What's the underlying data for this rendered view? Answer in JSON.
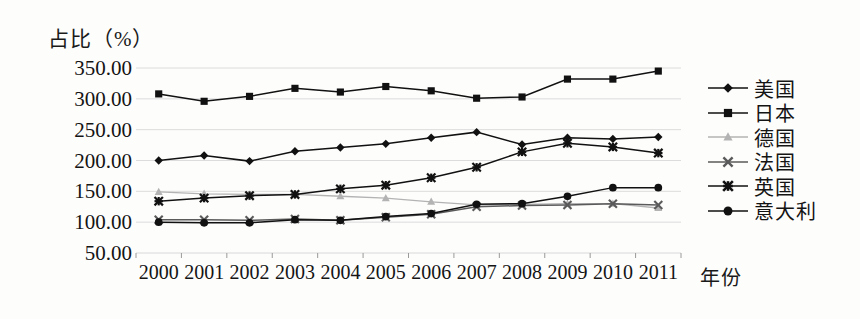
{
  "axis": {
    "y_title": "占比（%）",
    "x_title": "年份",
    "y_ticks": [
      "350.00",
      "300.00",
      "250.00",
      "200.00",
      "150.00",
      "100.00",
      "50.00"
    ],
    "x_ticks": [
      "2000",
      "2001",
      "2002",
      "2003",
      "2004",
      "2005",
      "2006",
      "2007",
      "2008",
      "2009",
      "2010",
      "2011"
    ]
  },
  "legend": {
    "items": [
      {
        "label": "美国",
        "marker": "diamond",
        "color": "#111111"
      },
      {
        "label": "日本",
        "marker": "square",
        "color": "#111111"
      },
      {
        "label": "德国",
        "marker": "triangle",
        "color": "#b3b3b3"
      },
      {
        "label": "法国",
        "marker": "cross-x",
        "color": "#5a5a5a"
      },
      {
        "label": "英国",
        "marker": "asterisk",
        "color": "#111111"
      },
      {
        "label": "意大利",
        "marker": "circle",
        "color": "#111111"
      }
    ]
  },
  "chart_data": {
    "type": "line",
    "title": "",
    "xlabel": "年份",
    "ylabel": "占比（%）",
    "x": [
      "2000",
      "2001",
      "2002",
      "2003",
      "2004",
      "2005",
      "2006",
      "2007",
      "2008",
      "2009",
      "2010",
      "2011"
    ],
    "ylim": [
      50,
      350
    ],
    "ytick_step": 50,
    "grid": true,
    "legend_position": "right",
    "series": [
      {
        "name": "美国",
        "marker": "diamond",
        "color": "#111111",
        "values": [
          200,
          208,
          199,
          215,
          221,
          227,
          237,
          246,
          226,
          237,
          235,
          238
        ]
      },
      {
        "name": "日本",
        "marker": "square",
        "color": "#111111",
        "values": [
          308,
          296,
          304,
          317,
          311,
          320,
          313,
          301,
          303,
          332,
          332,
          345
        ]
      },
      {
        "name": "德国",
        "marker": "triangle",
        "color": "#b3b3b3",
        "values": [
          149,
          146,
          145,
          145,
          142,
          139,
          133,
          128,
          129,
          130,
          130,
          123
        ]
      },
      {
        "name": "法国",
        "marker": "cross-x",
        "color": "#5a5a5a",
        "values": [
          104,
          104,
          103,
          105,
          103,
          108,
          113,
          125,
          127,
          128,
          130,
          128
        ]
      },
      {
        "name": "英国",
        "marker": "asterisk",
        "color": "#111111",
        "values": [
          134,
          139,
          143,
          145,
          154,
          160,
          172,
          189,
          214,
          228,
          222,
          212
        ]
      },
      {
        "name": "意大利",
        "marker": "circle",
        "color": "#111111",
        "values": [
          100,
          99,
          99,
          104,
          103,
          109,
          114,
          129,
          130,
          142,
          156,
          156
        ]
      }
    ]
  }
}
